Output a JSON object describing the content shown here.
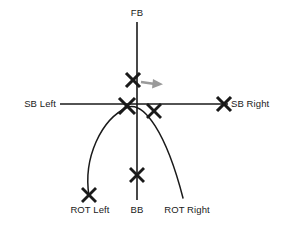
{
  "diagram": {
    "colors": {
      "line": "#1a1a1a",
      "arrow": "#9a9a9a",
      "background": "#ffffff"
    },
    "labels": {
      "fb": "FB",
      "sb_left": "SB Left",
      "sb_right": "SB Right",
      "rot_left": "ROT Left",
      "bb": "BB",
      "rot_right": "ROT Right"
    },
    "markers": [
      {
        "name": "fb-marker",
        "label": "FB",
        "x": 133,
        "y": 80,
        "size": 8
      },
      {
        "name": "origin-left-marker",
        "label": "SB Left",
        "x": 127,
        "y": 106,
        "size": 9
      },
      {
        "name": "origin-right-marker",
        "label": "ROT Right",
        "x": 154,
        "y": 111,
        "size": 8
      },
      {
        "name": "sb-right-marker",
        "label": "SB Right",
        "x": 224,
        "y": 104,
        "size": 8
      },
      {
        "name": "bb-marker",
        "label": "BB",
        "x": 137,
        "y": 175,
        "size": 8
      },
      {
        "name": "rot-left-marker",
        "label": "ROT Left",
        "x": 89,
        "y": 195,
        "size": 8
      }
    ],
    "axes": {
      "vertical": {
        "x": 137,
        "y1": 22,
        "y2": 200
      },
      "horizontal": {
        "y": 104,
        "x1": 60,
        "x2": 228
      }
    },
    "arc": {
      "description": "curved ball path arc",
      "path": "M 89 196 C 84 160, 100 120, 127 107 C 143 103, 165 130, 183 198"
    },
    "direction_arrow": {
      "description": "gray arrow pointing right from FB marker",
      "x1": 141,
      "y1": 82,
      "x2": 156,
      "y2": 84
    }
  }
}
